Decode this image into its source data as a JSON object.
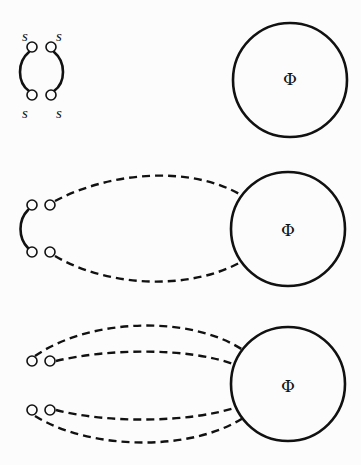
{
  "diagram": {
    "colors": {
      "background": "#fcfcfc",
      "stroke": "#111111"
    },
    "panels": [
      {
        "id": "panel-1",
        "circle_label": "Φ",
        "endpoint_labels": [
          "s",
          "s",
          "s",
          "s"
        ],
        "connections": "two solid arcs joining endpoint pairs; no link to circle"
      },
      {
        "id": "panel-2",
        "circle_label": "Φ",
        "endpoint_labels": [],
        "connections": "one solid arc on left pair; two dashed curves from right endpoints to circle"
      },
      {
        "id": "panel-3",
        "circle_label": "Φ",
        "endpoint_labels": [],
        "connections": "four dashed curves from all endpoints to circle"
      }
    ]
  }
}
